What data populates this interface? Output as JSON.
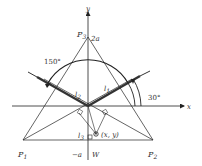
{
  "diagram": {
    "axis_labels": {
      "x": "x",
      "y": "y"
    },
    "points": {
      "p1": {
        "base": "P",
        "sub": "1"
      },
      "p2": {
        "base": "P",
        "sub": "2"
      },
      "p3": {
        "base": "P",
        "sub": "3"
      }
    },
    "apex_value": "2a",
    "bottom_value": "−a",
    "weight_label": "W",
    "point_label": "(x, y)",
    "lengths": {
      "l1": {
        "base": "l",
        "sub": "1"
      },
      "l2": {
        "base": "l",
        "sub": "2"
      },
      "l3": {
        "base": "l",
        "sub": "3"
      }
    },
    "angles": {
      "a30": "30°",
      "a150": "150°"
    },
    "colors": {
      "line": "#222222",
      "thick": "#333333"
    }
  }
}
